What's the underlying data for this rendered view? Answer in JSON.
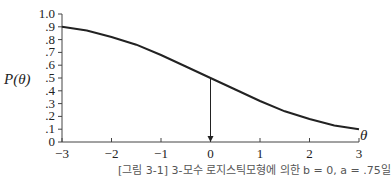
{
  "chart_data": {
    "type": "line",
    "title": "",
    "xlabel": "θ",
    "ylabel": "P(θ)",
    "xlim": [
      -3,
      3
    ],
    "ylim": [
      0,
      1.0
    ],
    "x_ticks": [
      "−3",
      "−2",
      "−1",
      "0",
      "1",
      "2",
      "3"
    ],
    "y_ticks": [
      "0",
      ".1",
      ".2",
      ".3",
      ".4",
      ".5",
      ".6",
      ".7",
      ".8",
      ".9",
      "1.0"
    ],
    "grid": false,
    "legend": null,
    "series": [
      {
        "name": "P(θ)",
        "x": [
          -3,
          -2.5,
          -2,
          -1.5,
          -1,
          -0.5,
          0,
          0.5,
          1,
          1.5,
          2,
          2.5,
          3
        ],
        "values": [
          0.9,
          0.87,
          0.82,
          0.76,
          0.68,
          0.59,
          0.5,
          0.41,
          0.32,
          0.24,
          0.18,
          0.13,
          0.1
        ]
      }
    ],
    "annotations": [
      {
        "type": "arrow",
        "from": [
          0,
          0.5
        ],
        "to": [
          0,
          0
        ],
        "label": ""
      }
    ]
  },
  "caption": "[그림 3-1] 3-모수 로지스틱모형에 의한 b = 0, a = .75일"
}
